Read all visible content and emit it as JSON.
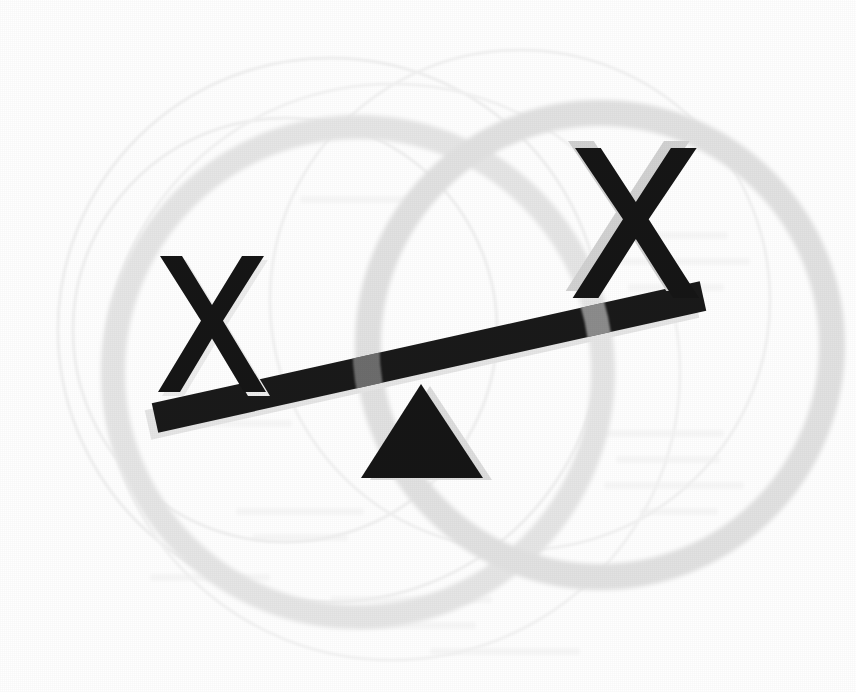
{
  "image": {
    "title": "Unbalanced seesaw with two X marks",
    "width": 856,
    "height": 692,
    "background_color": "#ffffff",
    "description": "Clip-art style line illustration of a tilted seesaw (lever and triangular fulcrum) with a bold letter X resting on each end, over faint overlapping circle outlines."
  },
  "palette": {
    "ink_black": "#161616",
    "beam_black": "#1a1a1a",
    "overlap_gray": "#4d4d4d",
    "shadow_light": "#dcdcdc",
    "shadow_soft": "#ededed",
    "ring_gray": "#e2e2e2",
    "ring_gray_dark": "#d6d6d6",
    "hairline_gray": "#f0f0f0",
    "paper_white": "#ffffff"
  },
  "elements": {
    "left_mark": {
      "name": "left-x-mark",
      "glyph": "X",
      "size_label": "small",
      "bbox": [
        158,
        256,
        106,
        136
      ],
      "rotation_deg": 0,
      "fill": "#161616",
      "shadow_offset": [
        4,
        4
      ],
      "shadow_fill": "#ededed",
      "position_label": "raised-left-end-of-beam"
    },
    "right_mark": {
      "name": "right-x-mark",
      "glyph": "X",
      "size_label": "large",
      "bbox": [
        573,
        148,
        124,
        150
      ],
      "rotation_deg": 0,
      "fill": "#161616",
      "shadow_offset": [
        -7,
        -7
      ],
      "shadow_fill": "#d2d2d2",
      "position_label": "lowered-right-end-of-beam"
    },
    "beam": {
      "name": "seesaw-beam",
      "left_end": [
        155,
        418
      ],
      "right_end": [
        703,
        296
      ],
      "thickness": 30,
      "tilt_deg": -12.6,
      "fill": "#1a1a1a",
      "shadow_fill": "#e6e6e6",
      "shadow_offset": [
        -7,
        7
      ]
    },
    "fulcrum": {
      "name": "fulcrum-triangle",
      "apex": [
        421,
        384
      ],
      "base_left": [
        361,
        478
      ],
      "base_right": [
        483,
        478
      ],
      "fill": "#161616",
      "shadow_fill": "#dedede",
      "shadow_offset": [
        9,
        2
      ]
    },
    "rings": [
      {
        "name": "background-ring-large-right",
        "center": [
          600,
          345
        ],
        "radius": 232,
        "stroke_width": 26,
        "stroke": "#e2e2e2"
      },
      {
        "name": "background-ring-large-left",
        "center": [
          358,
          372
        ],
        "radius": 245,
        "stroke_width": 24,
        "stroke": "#e6e6e6"
      },
      {
        "name": "background-ring-hairline-outer",
        "center": [
          330,
          330
        ],
        "radius": 272,
        "stroke_width": 3,
        "stroke": "#f1f1f1"
      },
      {
        "name": "background-ring-hairline-inner",
        "center": [
          285,
          330
        ],
        "radius": 212,
        "stroke_width": 3,
        "stroke": "#f1f1f1"
      },
      {
        "name": "background-ring-hairline-top",
        "center": [
          520,
          300
        ],
        "radius": 250,
        "stroke_width": 3,
        "stroke": "#f3f3f3"
      }
    ],
    "bleed_text": {
      "name": "page-bleed-through",
      "visible": true,
      "legible": false,
      "note": "Faint mirrored text showing through from the reverse of the printed page; not readable."
    }
  },
  "chart_data": {
    "type": "diagram",
    "categories": [
      "left X",
      "right X"
    ],
    "values": [
      1,
      2
    ],
    "note": "The right-hand X is drawn larger and sits lower, indicating greater weight; the beam tilts down to the right."
  }
}
